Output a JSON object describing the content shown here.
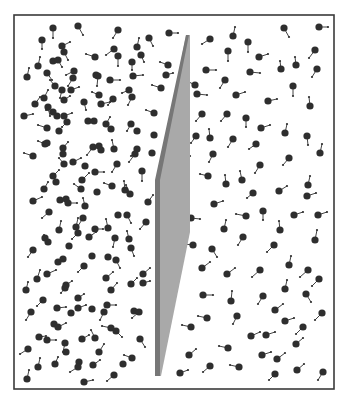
{
  "diagram": {
    "type": "particle-simulation",
    "canvas": {
      "width": 350,
      "height": 402,
      "background": "#ffffff"
    },
    "box": {
      "x": 14,
      "y": 15,
      "width": 320,
      "height": 374,
      "stroke": "#3a3a3a",
      "stroke_width": 1.6
    },
    "piston": {
      "face_color": "#a9a9a9",
      "edge_color": "#777777",
      "face_points": [
        [
          186,
          35
        ],
        [
          190,
          35
        ],
        [
          190,
          232
        ],
        [
          161,
          376
        ],
        [
          158,
          376
        ],
        [
          158,
          180
        ]
      ],
      "edge_points": [
        [
          186,
          35
        ],
        [
          189,
          35
        ],
        [
          160,
          180
        ],
        [
          160,
          376
        ],
        [
          155,
          376
        ],
        [
          155,
          180
        ]
      ]
    },
    "particle_style": {
      "radius": 3.6,
      "fill": "#2e2e2e",
      "tail_color": "#2e2e2e",
      "tail_width": 0.9,
      "tail_tip_radius": 1.1
    },
    "particles_left": [
      [
        53,
        28,
        53,
        38
      ],
      [
        78,
        26,
        83,
        35
      ],
      [
        118,
        30,
        113,
        38
      ],
      [
        149,
        38,
        153,
        46
      ],
      [
        169,
        33,
        178,
        33
      ],
      [
        42,
        40,
        42,
        49
      ],
      [
        62,
        46,
        70,
        42
      ],
      [
        64,
        52,
        68,
        60
      ],
      [
        114,
        49,
        106,
        55
      ],
      [
        137,
        47,
        139,
        38
      ],
      [
        95,
        57,
        86,
        54
      ],
      [
        118,
        56,
        118,
        66
      ],
      [
        141,
        55,
        144,
        62
      ],
      [
        53,
        61,
        53,
        61
      ],
      [
        58,
        60,
        62,
        67
      ],
      [
        38,
        66,
        40,
        57
      ],
      [
        132,
        62,
        132,
        70
      ],
      [
        168,
        65,
        160,
        62
      ],
      [
        27,
        77,
        29,
        68
      ],
      [
        47,
        73,
        52,
        80
      ],
      [
        74,
        71,
        66,
        75
      ],
      [
        96,
        75,
        96,
        75
      ],
      [
        98,
        76,
        97,
        86
      ],
      [
        73,
        78,
        68,
        86
      ],
      [
        110,
        80,
        120,
        80
      ],
      [
        133,
        76,
        143,
        75
      ],
      [
        166,
        75,
        173,
        73
      ],
      [
        55,
        86,
        50,
        80
      ],
      [
        62,
        90,
        60,
        98
      ],
      [
        71,
        90,
        79,
        87
      ],
      [
        129,
        90,
        122,
        93
      ],
      [
        161,
        88,
        152,
        85
      ],
      [
        132,
        97,
        128,
        105
      ],
      [
        99,
        95,
        92,
        92
      ],
      [
        113,
        99,
        108,
        105
      ],
      [
        44,
        98,
        48,
        90
      ],
      [
        64,
        100,
        70,
        96
      ],
      [
        84,
        102,
        86,
        110
      ],
      [
        101,
        104,
        110,
        102
      ],
      [
        35,
        104,
        40,
        97
      ],
      [
        48,
        107,
        50,
        116
      ],
      [
        53,
        112,
        46,
        110
      ],
      [
        57,
        116,
        57,
        116
      ],
      [
        64,
        116,
        72,
        113
      ],
      [
        24,
        116,
        33,
        114
      ],
      [
        154,
        113,
        146,
        110
      ],
      [
        67,
        122,
        62,
        127
      ],
      [
        88,
        121,
        88,
        121
      ],
      [
        94,
        121,
        94,
        121
      ],
      [
        106,
        124,
        110,
        117
      ],
      [
        131,
        124,
        127,
        131
      ],
      [
        47,
        128,
        38,
        125
      ],
      [
        59,
        131,
        59,
        131
      ],
      [
        111,
        129,
        111,
        129
      ],
      [
        137,
        131,
        137,
        131
      ],
      [
        45,
        144,
        38,
        141
      ],
      [
        47,
        143,
        47,
        143
      ],
      [
        63,
        148,
        68,
        142
      ],
      [
        63,
        154,
        63,
        154
      ],
      [
        33,
        156,
        24,
        153
      ],
      [
        93,
        147,
        87,
        155
      ],
      [
        99,
        146,
        99,
        146
      ],
      [
        101,
        150,
        101,
        150
      ],
      [
        114,
        149,
        112,
        140
      ],
      [
        137,
        149,
        131,
        156
      ],
      [
        135,
        154,
        129,
        162
      ],
      [
        154,
        135,
        154,
        135
      ],
      [
        152,
        153,
        152,
        153
      ],
      [
        64,
        164,
        59,
        158
      ],
      [
        73,
        162,
        81,
        158
      ],
      [
        85,
        166,
        85,
        166
      ],
      [
        117,
        164,
        112,
        172
      ],
      [
        95,
        172,
        104,
        172
      ],
      [
        142,
        171,
        142,
        181
      ],
      [
        53,
        176,
        59,
        170
      ],
      [
        56,
        182,
        56,
        182
      ],
      [
        82,
        180,
        89,
        173
      ],
      [
        81,
        189,
        74,
        184
      ],
      [
        112,
        186,
        104,
        183
      ],
      [
        97,
        192,
        97,
        192
      ],
      [
        125,
        190,
        124,
        181
      ],
      [
        130,
        194,
        126,
        185
      ],
      [
        44,
        189,
        48,
        182
      ],
      [
        33,
        201,
        42,
        197
      ],
      [
        60,
        200,
        60,
        200
      ],
      [
        66,
        199,
        66,
        199
      ],
      [
        68,
        203,
        77,
        203
      ],
      [
        85,
        206,
        83,
        198
      ],
      [
        148,
        202,
        153,
        195
      ],
      [
        49,
        212,
        42,
        218
      ],
      [
        83,
        218,
        78,
        226
      ],
      [
        118,
        215,
        118,
        215
      ],
      [
        127,
        215,
        131,
        223
      ],
      [
        146,
        222,
        140,
        229
      ],
      [
        59,
        230,
        61,
        221
      ],
      [
        76,
        227,
        78,
        218
      ],
      [
        78,
        233,
        72,
        239
      ],
      [
        95,
        229,
        103,
        229
      ],
      [
        108,
        228,
        106,
        219
      ],
      [
        89,
        237,
        96,
        232
      ],
      [
        115,
        238,
        113,
        247
      ],
      [
        129,
        239,
        127,
        231
      ],
      [
        45,
        238,
        45,
        238
      ],
      [
        48,
        242,
        44,
        235
      ],
      [
        69,
        246,
        69,
        246
      ],
      [
        131,
        248,
        134,
        256
      ],
      [
        33,
        250,
        28,
        257
      ],
      [
        58,
        262,
        58,
        262
      ],
      [
        63,
        259,
        63,
        259
      ],
      [
        92,
        256,
        92,
        256
      ],
      [
        108,
        257,
        108,
        257
      ],
      [
        116,
        260,
        120,
        268
      ],
      [
        84,
        266,
        78,
        272
      ],
      [
        47,
        274,
        56,
        270
      ],
      [
        37,
        279,
        40,
        270
      ],
      [
        106,
        278,
        113,
        272
      ],
      [
        143,
        274,
        150,
        268
      ],
      [
        143,
        283,
        150,
        281
      ],
      [
        131,
        284,
        137,
        278
      ],
      [
        66,
        285,
        72,
        281
      ],
      [
        65,
        288,
        61,
        293
      ],
      [
        26,
        290,
        28,
        282
      ],
      [
        111,
        290,
        117,
        283
      ],
      [
        78,
        298,
        84,
        294
      ],
      [
        43,
        300,
        37,
        306
      ],
      [
        57,
        308,
        66,
        307
      ],
      [
        78,
        308,
        86,
        305
      ],
      [
        71,
        313,
        71,
        313
      ],
      [
        92,
        309,
        92,
        309
      ],
      [
        107,
        305,
        116,
        305
      ],
      [
        104,
        312,
        100,
        320
      ],
      [
        31,
        312,
        26,
        320
      ],
      [
        134,
        311,
        134,
        311
      ],
      [
        139,
        312,
        132,
        318
      ],
      [
        54,
        324,
        54,
        324
      ],
      [
        58,
        327,
        66,
        323
      ],
      [
        111,
        328,
        102,
        326
      ],
      [
        116,
        331,
        122,
        337
      ],
      [
        39,
        337,
        46,
        336
      ],
      [
        47,
        340,
        56,
        340
      ],
      [
        65,
        343,
        63,
        352
      ],
      [
        82,
        339,
        89,
        335
      ],
      [
        95,
        338,
        91,
        330
      ],
      [
        140,
        339,
        145,
        347
      ],
      [
        28,
        349,
        20,
        354
      ],
      [
        66,
        352,
        66,
        352
      ],
      [
        99,
        352,
        104,
        344
      ],
      [
        132,
        358,
        124,
        355
      ],
      [
        123,
        364,
        123,
        364
      ],
      [
        79,
        362,
        79,
        362
      ],
      [
        78,
        367,
        70,
        372
      ],
      [
        93,
        365,
        100,
        360
      ],
      [
        55,
        364,
        58,
        357
      ],
      [
        38,
        367,
        40,
        358
      ],
      [
        114,
        375,
        107,
        381
      ],
      [
        27,
        379,
        29,
        370
      ],
      [
        84,
        382,
        93,
        380
      ]
    ],
    "particles_right": [
      [
        210,
        39,
        202,
        44
      ],
      [
        233,
        36,
        235,
        27
      ],
      [
        248,
        42,
        248,
        52
      ],
      [
        284,
        28,
        289,
        37
      ],
      [
        319,
        27,
        328,
        27
      ],
      [
        228,
        51,
        228,
        61
      ],
      [
        259,
        57,
        268,
        54
      ],
      [
        281,
        69,
        280,
        61
      ],
      [
        296,
        65,
        295,
        57
      ],
      [
        315,
        50,
        309,
        58
      ],
      [
        206,
        70,
        216,
        70
      ],
      [
        250,
        72,
        260,
        73
      ],
      [
        225,
        80,
        220,
        88
      ],
      [
        195,
        85,
        187,
        81
      ],
      [
        317,
        69,
        312,
        77
      ],
      [
        197,
        94,
        207,
        95
      ],
      [
        236,
        95,
        245,
        92
      ],
      [
        293,
        86,
        293,
        96
      ],
      [
        268,
        101,
        277,
        99
      ],
      [
        310,
        106,
        309,
        97
      ],
      [
        202,
        114,
        196,
        121
      ],
      [
        227,
        114,
        221,
        121
      ],
      [
        246,
        118,
        246,
        127
      ],
      [
        261,
        128,
        270,
        125
      ],
      [
        285,
        133,
        287,
        124
      ],
      [
        307,
        136,
        308,
        145
      ],
      [
        196,
        136,
        191,
        143
      ],
      [
        210,
        138,
        209,
        129
      ],
      [
        233,
        139,
        228,
        147
      ],
      [
        256,
        144,
        249,
        149
      ],
      [
        320,
        153,
        322,
        144
      ],
      [
        213,
        154,
        209,
        162
      ],
      [
        181,
        156,
        190,
        156
      ],
      [
        289,
        158,
        283,
        165
      ],
      [
        260,
        165,
        255,
        173
      ],
      [
        208,
        176,
        200,
        174
      ],
      [
        226,
        184,
        225,
        175
      ],
      [
        242,
        180,
        240,
        171
      ],
      [
        253,
        193,
        247,
        198
      ],
      [
        279,
        191,
        287,
        186
      ],
      [
        308,
        185,
        310,
        176
      ],
      [
        307,
        196,
        316,
        193
      ],
      [
        214,
        204,
        223,
        201
      ],
      [
        191,
        218,
        200,
        219
      ],
      [
        246,
        216,
        236,
        214
      ],
      [
        263,
        211,
        263,
        220
      ],
      [
        294,
        215,
        303,
        212
      ],
      [
        318,
        215,
        327,
        212
      ],
      [
        224,
        229,
        226,
        220
      ],
      [
        280,
        230,
        279,
        221
      ],
      [
        243,
        237,
        238,
        245
      ],
      [
        315,
        240,
        317,
        230
      ],
      [
        193,
        245,
        184,
        244
      ],
      [
        212,
        249,
        217,
        257
      ],
      [
        274,
        245,
        267,
        252
      ],
      [
        289,
        265,
        291,
        256
      ],
      [
        202,
        268,
        210,
        262
      ],
      [
        227,
        274,
        235,
        268
      ],
      [
        260,
        270,
        252,
        277
      ],
      [
        308,
        270,
        300,
        277
      ],
      [
        319,
        279,
        312,
        286
      ],
      [
        285,
        289,
        287,
        280
      ],
      [
        203,
        295,
        213,
        295
      ],
      [
        231,
        301,
        232,
        291
      ],
      [
        263,
        296,
        258,
        304
      ],
      [
        306,
        294,
        311,
        302
      ],
      [
        275,
        310,
        283,
        304
      ],
      [
        237,
        316,
        233,
        324
      ],
      [
        207,
        318,
        198,
        316
      ],
      [
        285,
        321,
        294,
        318
      ],
      [
        322,
        313,
        315,
        320
      ],
      [
        191,
        327,
        182,
        325
      ],
      [
        303,
        327,
        296,
        334
      ],
      [
        251,
        336,
        260,
        332
      ],
      [
        266,
        335,
        275,
        332
      ],
      [
        228,
        348,
        219,
        346
      ],
      [
        296,
        344,
        303,
        338
      ],
      [
        189,
        355,
        196,
        349
      ],
      [
        262,
        355,
        271,
        352
      ],
      [
        277,
        359,
        285,
        353
      ],
      [
        210,
        366,
        203,
        372
      ],
      [
        239,
        367,
        230,
        365
      ],
      [
        180,
        373,
        188,
        370
      ],
      [
        297,
        370,
        304,
        364
      ],
      [
        323,
        372,
        318,
        380
      ],
      [
        275,
        374,
        269,
        380
      ]
    ]
  }
}
